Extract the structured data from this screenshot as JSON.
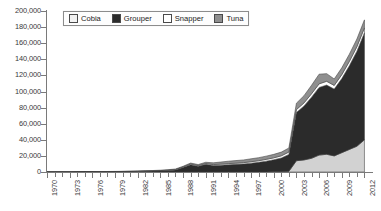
{
  "chart_data": {
    "type": "area",
    "stacked": true,
    "title": "",
    "subtitle": "",
    "xlabel": "",
    "ylabel": "",
    "xlim": [
      1970,
      2013
    ],
    "ylim": [
      0,
      200000
    ],
    "grid": false,
    "legend_position": "top-center",
    "y_tick_labels": [
      "200,000",
      "180,000",
      "160,000",
      "140,000",
      "120,000",
      "100,000",
      "80,000",
      "60,000",
      "40,000",
      "20,000",
      "0"
    ],
    "y_tick_values": [
      200000,
      180000,
      160000,
      140000,
      120000,
      100000,
      80000,
      60000,
      40000,
      20000,
      0
    ],
    "x_tick_labels": [
      "1970",
      "1973",
      "1976",
      "1979",
      "1982",
      "1985",
      "1988",
      "1991",
      "1994",
      "1997",
      "2000",
      "2003",
      "2006",
      "2009",
      "2012"
    ],
    "x_tick_values": [
      1970,
      1973,
      1976,
      1979,
      1982,
      1985,
      1988,
      1991,
      1994,
      1997,
      2000,
      2003,
      2006,
      2009,
      2012
    ],
    "x": [
      1970,
      1971,
      1972,
      1973,
      1974,
      1975,
      1976,
      1977,
      1978,
      1979,
      1980,
      1981,
      1982,
      1983,
      1984,
      1985,
      1986,
      1987,
      1988,
      1989,
      1990,
      1991,
      1992,
      1993,
      1994,
      1995,
      1996,
      1997,
      1998,
      1999,
      2000,
      2001,
      2002,
      2003,
      2004,
      2005,
      2006,
      2007,
      2008,
      2009,
      2010,
      2011,
      2012
    ],
    "series": [
      {
        "name": "Cobia",
        "color": "#d2d2d2",
        "stack_order": 1,
        "values": [
          0,
          0,
          0,
          0,
          0,
          0,
          0,
          0,
          0,
          0,
          0,
          0,
          0,
          0,
          0,
          0,
          0,
          0,
          0,
          0,
          0,
          0,
          0,
          0,
          0,
          0,
          0,
          0,
          0,
          0,
          200,
          400,
          800,
          14000,
          15000,
          17000,
          21000,
          22000,
          20000,
          24000,
          28000,
          32000,
          40000
        ]
      },
      {
        "name": "Grouper",
        "color": "#2b2b2b",
        "stack_order": 2,
        "values": [
          100,
          100,
          150,
          150,
          200,
          200,
          250,
          300,
          350,
          400,
          500,
          600,
          700,
          900,
          1100,
          1400,
          1800,
          2500,
          5500,
          9000,
          7000,
          9500,
          8000,
          8500,
          9000,
          9500,
          10000,
          11000,
          12000,
          13500,
          15000,
          17000,
          21000,
          60000,
          67000,
          76000,
          84000,
          86000,
          83000,
          92000,
          104000,
          118000,
          133000
        ]
      },
      {
        "name": "Snapper",
        "color": "#ffffff",
        "stack_order": 3,
        "values": [
          50,
          50,
          60,
          60,
          70,
          80,
          90,
          100,
          120,
          140,
          160,
          190,
          220,
          260,
          300,
          360,
          430,
          520,
          700,
          900,
          950,
          1100,
          1200,
          1300,
          1400,
          1500,
          1600,
          1800,
          2000,
          2200,
          2400,
          2700,
          3000,
          3500,
          3800,
          4200,
          4500,
          4700,
          4600,
          4900,
          5300,
          5700,
          6000
        ]
      },
      {
        "name": "Tuna",
        "color": "#8f8f8f",
        "stack_order": 4,
        "values": [
          50,
          50,
          60,
          70,
          80,
          90,
          110,
          130,
          150,
          180,
          210,
          250,
          300,
          360,
          430,
          520,
          620,
          750,
          900,
          1200,
          1300,
          1500,
          2200,
          2600,
          3000,
          3200,
          3400,
          3600,
          3800,
          4000,
          4300,
          4600,
          5000,
          8000,
          9000,
          10500,
          12000,
          9500,
          8000,
          8500,
          9000,
          9500,
          10000
        ]
      }
    ],
    "totals": [
      200,
      200,
      270,
      280,
      350,
      370,
      450,
      530,
      620,
      720,
      870,
      1040,
      1220,
      1520,
      1830,
      2280,
      2850,
      3770,
      7100,
      11100,
      9250,
      12100,
      11400,
      12400,
      13400,
      14200,
      15000,
      16400,
      17800,
      19700,
      21900,
      24700,
      29800,
      85500,
      94800,
      107700,
      121500,
      122200,
      115600,
      129400,
      146300,
      165200,
      189000
    ]
  },
  "legend": {
    "items": [
      {
        "label": "Cobia",
        "swatch": "#f2f2f2",
        "pattern": "solid"
      },
      {
        "label": "Grouper",
        "swatch": "#2b2b2b",
        "pattern": "solid"
      },
      {
        "label": "Snapper",
        "swatch": "#ffffff",
        "pattern": "solid"
      },
      {
        "label": "Tuna",
        "swatch": "#8f8f8f",
        "pattern": "hatched"
      }
    ]
  },
  "axes": {
    "y_label_0": "0",
    "y_label_1": "20,000",
    "y_label_2": "40,000",
    "y_label_3": "60,000",
    "y_label_4": "80,000",
    "y_label_5": "100,000",
    "y_label_6": "120,000",
    "y_label_7": "140,000",
    "y_label_8": "160,000",
    "y_label_9": "180,000",
    "y_label_10": "200,000"
  },
  "colors": {
    "axis": "#7a7a7a",
    "text": "#3a3a3a",
    "legend_border": "#8c8c8c",
    "background": "#ffffff"
  }
}
